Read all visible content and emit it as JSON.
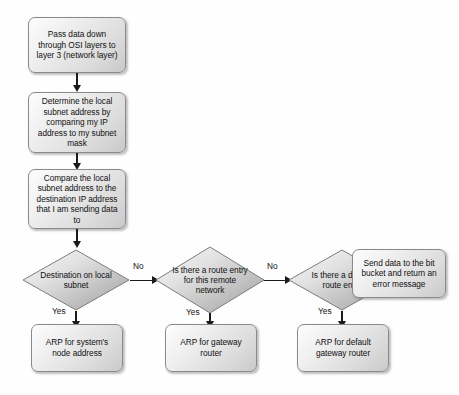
{
  "diagram": {
    "type": "flowchart",
    "colors": {
      "shape_border": "#8a8a8a",
      "shape_fill_light": "#fdfdfd",
      "shape_fill_dark": "#c9c9c9",
      "diamond_fill_light": "#f2f2f2",
      "diamond_fill_dark": "#a8a8a8",
      "connector": "#1a1a1a",
      "text": "#111111",
      "background": "#fefefe"
    },
    "process_nodes": [
      {
        "id": "pass-data",
        "text": "Pass data down through OSI layers to layer 3 (network layer)"
      },
      {
        "id": "determine-subnet",
        "text": "Determine the local subnet address by comparing my IP address to my subnet mask"
      },
      {
        "id": "compare-subnet",
        "text": "Compare the local subnet address to the destination IP address that I am sending data to"
      },
      {
        "id": "send-bit-bucket",
        "text": "Send data to the bit bucket and return an error message"
      },
      {
        "id": "arp-node",
        "text": "ARP for system's node address"
      },
      {
        "id": "arp-gateway",
        "text": "ARP for gateway router"
      },
      {
        "id": "arp-default-gateway",
        "text": "ARP for default gateway router"
      }
    ],
    "decision_nodes": [
      {
        "id": "dest-local",
        "text": "Destination on local subnet"
      },
      {
        "id": "route-entry",
        "text": "Is there a route entry for this remote network"
      },
      {
        "id": "default-route",
        "text": "Is there a default route entry"
      }
    ],
    "edge_labels": {
      "yes": "Yes",
      "no": "No"
    },
    "edges": [
      {
        "from": "pass-data",
        "to": "determine-subnet",
        "label": ""
      },
      {
        "from": "determine-subnet",
        "to": "compare-subnet",
        "label": ""
      },
      {
        "from": "compare-subnet",
        "to": "dest-local",
        "label": ""
      },
      {
        "from": "dest-local",
        "to": "route-entry",
        "label": "No"
      },
      {
        "from": "dest-local",
        "to": "arp-node",
        "label": "Yes"
      },
      {
        "from": "route-entry",
        "to": "default-route",
        "label": "No"
      },
      {
        "from": "route-entry",
        "to": "arp-gateway",
        "label": "Yes"
      },
      {
        "from": "default-route",
        "to": "send-bit-bucket",
        "label": "No"
      },
      {
        "from": "default-route",
        "to": "arp-default-gateway",
        "label": "Yes"
      }
    ]
  }
}
